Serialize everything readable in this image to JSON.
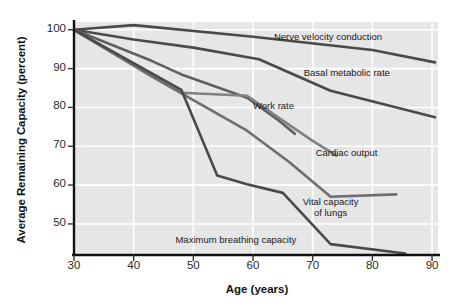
{
  "chart_data": {
    "type": "line",
    "title": "",
    "xlabel": "Age (years)",
    "ylabel": "Average Remaining Capacity (percent)",
    "xlim": [
      30,
      91
    ],
    "ylim": [
      42,
      102
    ],
    "xticks": [
      30,
      40,
      50,
      60,
      70,
      80,
      90
    ],
    "yticks": [
      50,
      60,
      70,
      80,
      90,
      100
    ],
    "grid": true,
    "grid_color": "#ffffff",
    "plot_bg": "#e6e6e6",
    "legend": "inline-labels",
    "series": [
      {
        "name": "Nerve velocity conduction",
        "color": "#4a4a4a",
        "label_x": 63.5,
        "label_y": 98.0,
        "x": [
          30,
          40,
          60,
          80,
          90.5
        ],
        "y": [
          100,
          101.2,
          98.2,
          94.8,
          91.6
        ]
      },
      {
        "name": "Basal metabolic rate",
        "color": "#4a4a4a",
        "label_x": 68.5,
        "label_y": 88.5,
        "x": [
          30,
          40,
          50,
          61,
          73,
          90.5
        ],
        "y": [
          100,
          97.5,
          95.4,
          92.4,
          84.3,
          77.5
        ]
      },
      {
        "name": "Work rate",
        "color": "#5f5f5f",
        "label_x": 60.0,
        "label_y": 80.0,
        "x": [
          30,
          43,
          48,
          59,
          64,
          67
        ],
        "y": [
          100,
          92.0,
          88.5,
          82.5,
          77.0,
          73.2
        ]
      },
      {
        "name": "Cardiac output",
        "color": "#808080",
        "label_x": 70.5,
        "label_y": 68.0,
        "x": [
          30,
          48,
          59,
          65,
          70,
          74
        ],
        "y": [
          100,
          83.8,
          83.0,
          76.6,
          71.4,
          67.6
        ]
      },
      {
        "name": "Vital capacity of lungs",
        "color": "#6e6e6e",
        "label_x": 73.0,
        "label_y": 54.0,
        "label_lines": [
          "Vital capacity",
          "of lungs"
        ],
        "x": [
          30,
          43,
          59,
          66,
          73,
          84
        ],
        "y": [
          100,
          88.0,
          74.0,
          66.0,
          57.0,
          57.6
        ]
      },
      {
        "name": "Maximum breathing capacity",
        "color": "#4a4a4a",
        "label_x": 47.0,
        "label_y": 45.5,
        "x": [
          30,
          48,
          54,
          59,
          65,
          73,
          85.5
        ],
        "y": [
          100,
          84.5,
          62.5,
          60.2,
          58.0,
          44.8,
          42.4
        ]
      }
    ]
  }
}
